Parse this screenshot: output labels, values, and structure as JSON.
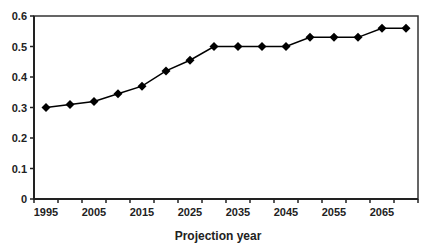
{
  "chart_data": {
    "type": "line",
    "title": "",
    "xlabel": "Projection year",
    "ylabel": "",
    "categories": [
      "1995",
      "2000",
      "2005",
      "2010",
      "2015",
      "2020",
      "2025",
      "2030",
      "2035",
      "2040",
      "2045",
      "2050",
      "2055",
      "2060",
      "2065",
      "2070"
    ],
    "x_tick_labels": [
      "1995",
      "2005",
      "2015",
      "2025",
      "2035",
      "2045",
      "2055",
      "2065"
    ],
    "y_tick_labels": [
      "0",
      "0.1",
      "0.2",
      "0.3",
      "0.4",
      "0.5",
      "0.6"
    ],
    "ylim": [
      0,
      0.6
    ],
    "grid": false,
    "legend": null,
    "series": [
      {
        "name": "Projection",
        "marker": "diamond",
        "color": "#000000",
        "values": [
          0.3,
          0.31,
          0.32,
          0.345,
          0.37,
          0.42,
          0.455,
          0.5,
          0.5,
          0.5,
          0.5,
          0.53,
          0.53,
          0.53,
          0.56,
          0.56
        ]
      }
    ]
  }
}
